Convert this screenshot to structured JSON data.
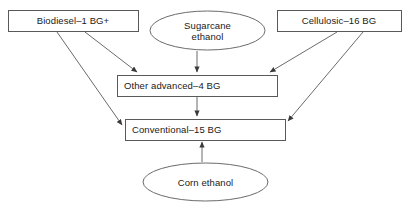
{
  "diagram": {
    "stroke_color": "#6b6b6b",
    "box_stroke_color": "#595959",
    "text_color": "#1a1a1a",
    "background_color": "#ffffff",
    "nodes": [
      {
        "id": "biodiesel",
        "shape": "rectangle",
        "label": "Biodiesel–1 BG+",
        "x": 8,
        "y": 10,
        "width": 130,
        "height": 21,
        "align": "center"
      },
      {
        "id": "sugarcane-ethanol",
        "shape": "ellipse",
        "label": "Sugarcane\nethanol",
        "x": 150,
        "y": 11,
        "width": 115,
        "height": 39,
        "align": "center"
      },
      {
        "id": "cellulosic",
        "shape": "rectangle",
        "label": "Cellulosic–16 BG",
        "x": 277,
        "y": 10,
        "width": 124,
        "height": 21,
        "align": "center"
      },
      {
        "id": "other-advanced",
        "shape": "rectangle",
        "label": "Other advanced–4 BG",
        "x": 117,
        "y": 75,
        "width": 160,
        "height": 21,
        "align": "left"
      },
      {
        "id": "conventional",
        "shape": "rectangle",
        "label": "Conventional–15 BG",
        "x": 125,
        "y": 119,
        "width": 160,
        "height": 21,
        "align": "left"
      },
      {
        "id": "corn-ethanol",
        "shape": "ellipse",
        "label": "Corn ethanol",
        "x": 143,
        "y": 163,
        "width": 125,
        "height": 38,
        "align": "center"
      }
    ],
    "edges": [
      {
        "id": "biodiesel-to-other-advanced",
        "from": "biodiesel",
        "to": "other-advanced",
        "x1": 85,
        "y1": 32,
        "x2": 137,
        "y2": 72
      },
      {
        "id": "biodiesel-to-conventional",
        "from": "biodiesel",
        "to": "conventional",
        "x1": 57,
        "y1": 32,
        "x2": 122,
        "y2": 125
      },
      {
        "id": "sugarcane-to-other-advanced",
        "from": "sugarcane-ethanol",
        "to": "other-advanced",
        "x1": 197,
        "y1": 51,
        "x2": 197,
        "y2": 72
      },
      {
        "id": "cellulosic-to-other-advanced",
        "from": "cellulosic",
        "to": "other-advanced",
        "x1": 337,
        "y1": 32,
        "x2": 270,
        "y2": 72
      },
      {
        "id": "cellulosic-to-conventional",
        "from": "cellulosic",
        "to": "conventional",
        "x1": 363,
        "y1": 32,
        "x2": 288,
        "y2": 121
      },
      {
        "id": "other-advanced-to-conventional",
        "from": "other-advanced",
        "to": "conventional",
        "x1": 197,
        "y1": 96,
        "x2": 197,
        "y2": 116
      },
      {
        "id": "corn-ethanol-to-conventional",
        "from": "corn-ethanol",
        "to": "conventional",
        "x1": 202,
        "y1": 162,
        "x2": 202,
        "y2": 142
      }
    ]
  }
}
